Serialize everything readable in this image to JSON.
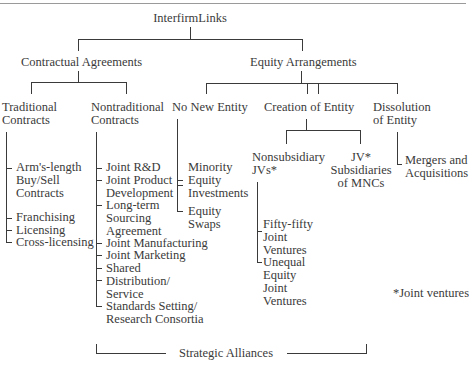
{
  "root": {
    "label": "InterfirmLinks"
  },
  "level1": [
    {
      "label": "Contractual Agreements"
    },
    {
      "label": "Equity Arrangements"
    }
  ],
  "contractual": {
    "traditional": {
      "label_lines": [
        "Traditional",
        "Contracts"
      ],
      "items": [
        {
          "lines": [
            "Arm's-length",
            "Buy/Sell",
            "Contracts"
          ]
        },
        {
          "lines": [
            "Franchising"
          ]
        },
        {
          "lines": [
            "Licensing"
          ]
        },
        {
          "lines": [
            "Cross-licensing"
          ]
        }
      ]
    },
    "nontraditional": {
      "label_lines": [
        "Nontraditional",
        "Contracts"
      ],
      "items": [
        {
          "lines": [
            "Joint R&D"
          ]
        },
        {
          "lines": [
            "Joint Product",
            "Development"
          ]
        },
        {
          "lines": [
            "Long-term",
            "Sourcing",
            "Agreement"
          ]
        },
        {
          "lines": [
            "Joint Manufacturing"
          ]
        },
        {
          "lines": [
            "Joint Marketing"
          ]
        },
        {
          "lines": [
            "Shared",
            "Distribution/",
            "Service"
          ]
        },
        {
          "lines": [
            "Standards Setting/",
            "Research Consortia"
          ]
        }
      ]
    }
  },
  "equity": {
    "no_new_entity": {
      "label": "No New Entity",
      "items": [
        {
          "lines": [
            "Minority",
            "Equity",
            "Investments"
          ]
        },
        {
          "lines": [
            "Equity",
            "Swaps"
          ]
        }
      ]
    },
    "creation_of_entity": {
      "label": "Creation of Entity",
      "nonsubsidiary": {
        "label_lines": [
          "Nonsubsidiary",
          "JVs*"
        ],
        "items": [
          {
            "lines": [
              "Fifty-fifty",
              "Joint",
              "Ventures"
            ]
          },
          {
            "lines": [
              "Unequal",
              "Equity",
              "Joint",
              "Ventures"
            ]
          }
        ]
      },
      "jv_subsidiaries": {
        "label_lines": [
          "JV*",
          "Subsidiaries",
          "of MNCs"
        ]
      }
    },
    "dissolution": {
      "label_lines": [
        "Dissolution",
        "of Entity"
      ],
      "items": [
        {
          "lines": [
            "Mergers and",
            "Acquisitions"
          ]
        }
      ]
    }
  },
  "footnote": "*Joint ventures",
  "bracket_label": "Strategic Alliances"
}
